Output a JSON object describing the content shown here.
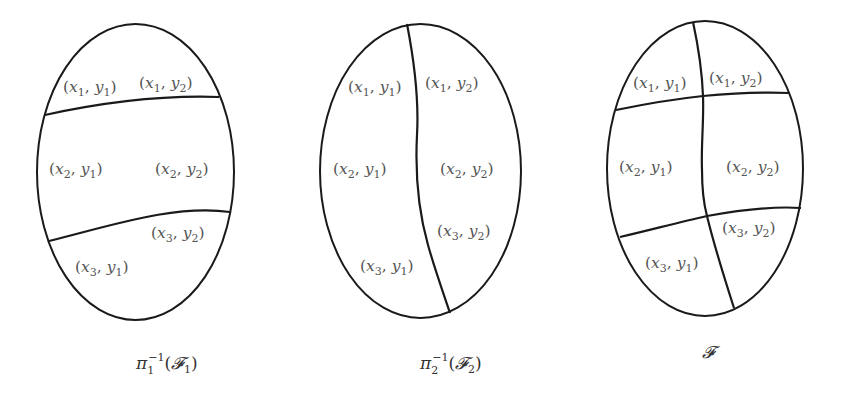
{
  "figure": {
    "stroke_color": "#1a1a1a",
    "label_color": "#555555",
    "panels": [
      {
        "id": "pi1-inverse-F1",
        "caption": {
          "symbol": "π",
          "subscript": "1",
          "superscript": "−1",
          "argument_open": "(",
          "argument_symbol": "𝓕",
          "argument_subscript": "1",
          "argument_close": ")"
        },
        "cells": [
          {
            "x": "x",
            "xi": "1",
            "y": "y",
            "yi": "1"
          },
          {
            "x": "x",
            "xi": "1",
            "y": "y",
            "yi": "2"
          },
          {
            "x": "x",
            "xi": "2",
            "y": "y",
            "yi": "1"
          },
          {
            "x": "x",
            "xi": "2",
            "y": "y",
            "yi": "2"
          },
          {
            "x": "x",
            "xi": "3",
            "y": "y",
            "yi": "2"
          },
          {
            "x": "x",
            "xi": "3",
            "y": "y",
            "yi": "1"
          }
        ]
      },
      {
        "id": "pi2-inverse-F2",
        "caption": {
          "symbol": "π",
          "subscript": "2",
          "superscript": "−1",
          "argument_open": "(",
          "argument_symbol": "𝓕",
          "argument_subscript": "2",
          "argument_close": ")"
        },
        "cells": [
          {
            "x": "x",
            "xi": "1",
            "y": "y",
            "yi": "1"
          },
          {
            "x": "x",
            "xi": "1",
            "y": "y",
            "yi": "2"
          },
          {
            "x": "x",
            "xi": "2",
            "y": "y",
            "yi": "1"
          },
          {
            "x": "x",
            "xi": "2",
            "y": "y",
            "yi": "2"
          },
          {
            "x": "x",
            "xi": "3",
            "y": "y",
            "yi": "2"
          },
          {
            "x": "x",
            "xi": "3",
            "y": "y",
            "yi": "1"
          }
        ]
      },
      {
        "id": "F",
        "caption": {
          "symbol": "𝓕"
        },
        "cells": [
          {
            "x": "x",
            "xi": "1",
            "y": "y",
            "yi": "1"
          },
          {
            "x": "x",
            "xi": "1",
            "y": "y",
            "yi": "2"
          },
          {
            "x": "x",
            "xi": "2",
            "y": "y",
            "yi": "1"
          },
          {
            "x": "x",
            "xi": "2",
            "y": "y",
            "yi": "2"
          },
          {
            "x": "x",
            "xi": "3",
            "y": "y",
            "yi": "2"
          },
          {
            "x": "x",
            "xi": "3",
            "y": "y",
            "yi": "1"
          }
        ]
      }
    ],
    "punctuation": {
      "open": "(",
      "comma": ", ",
      "close": ")"
    }
  }
}
